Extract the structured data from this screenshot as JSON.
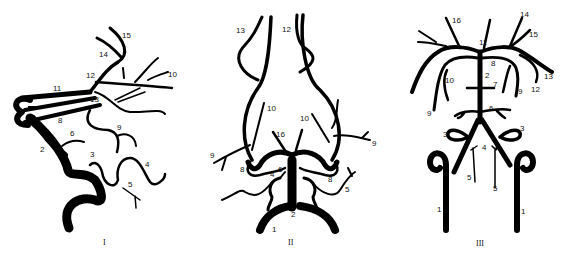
{
  "panels": [
    {
      "id": "I",
      "label": "I",
      "numbers": [
        "1",
        "2",
        "3",
        "4",
        "5",
        "6",
        "8",
        "9",
        "10",
        "11",
        "12",
        "13",
        "14",
        "15"
      ]
    },
    {
      "id": "II",
      "label": "II",
      "numbers": [
        "1",
        "1",
        "2",
        "4",
        "5",
        "6",
        "8",
        "8",
        "9",
        "9",
        "10",
        "10",
        "12",
        "13",
        "16"
      ]
    },
    {
      "id": "III",
      "label": "III",
      "numbers": [
        "1",
        "1",
        "2",
        "3",
        "3",
        "4",
        "5",
        "5",
        "6",
        "7",
        "8",
        "9",
        "9",
        "10",
        "11",
        "12",
        "13",
        "14",
        "15",
        "16"
      ]
    }
  ],
  "labels": {
    "p1": {
      "n1": "1",
      "n2": "2",
      "n3": "3",
      "n4": "4",
      "n5": "5",
      "n6": "6",
      "n8": "8",
      "n9": "9",
      "n10": "10",
      "n11": "11",
      "n12": "12",
      "n13": "13",
      "n14": "14",
      "n15": "15",
      "roman": "I"
    },
    "p2": {
      "n1a": "1",
      "n1b": "1",
      "n2": "2",
      "n4": "4",
      "n5": "5",
      "n6": "6",
      "n8a": "8",
      "n8b": "8",
      "n9a": "9",
      "n9b": "9",
      "n10a": "10",
      "n10b": "10",
      "n12": "12",
      "n13": "13",
      "n16": "16",
      "roman": "II"
    },
    "p3": {
      "n1a": "1",
      "n1b": "1",
      "n2": "2",
      "n3a": "3",
      "n3b": "3",
      "n4": "4",
      "n5a": "5",
      "n5b": "5",
      "n6": "6",
      "n7": "7",
      "n8": "8",
      "n9a": "9",
      "n9b": "9",
      "n10": "10",
      "n11": "11",
      "n12": "12",
      "n13": "13",
      "n14": "14",
      "n15": "15",
      "n16": "16",
      "roman": "III"
    }
  },
  "colors": {
    "vessel": "#000000",
    "background": "#ffffff"
  }
}
